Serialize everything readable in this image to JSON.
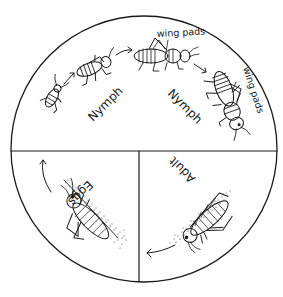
{
  "diagram": {
    "type": "cycle",
    "layout": "circle divided into top half and two bottom quadrants",
    "colors": {
      "ink": "#1a1a1a",
      "background": "#ffffff"
    },
    "sections": [
      {
        "id": "top-half",
        "stages": [
          {
            "label": "Nymph",
            "note": "young nymphs, small, no wing pads"
          },
          {
            "label": "Nymph",
            "note": "older nymphs with developing wing pads"
          }
        ],
        "annotations": [
          "wing pads",
          "wing pads"
        ]
      },
      {
        "id": "bottom-right",
        "stages": [
          {
            "label": "Adult"
          }
        ]
      },
      {
        "id": "bottom-left",
        "stages": [
          {
            "label": "Eggs"
          }
        ]
      }
    ],
    "labels": {
      "nymph_1": "Nymph",
      "nymph_2": "Nymph",
      "wing_pads_1": "wing pads",
      "wing_pads_2": "wing pads",
      "adult": "Adult",
      "eggs": "Eggs"
    },
    "flow": [
      "Eggs",
      "Nymph",
      "Nymph",
      "Adult",
      "Eggs"
    ]
  }
}
